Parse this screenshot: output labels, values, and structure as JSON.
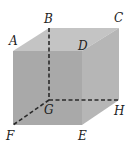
{
  "diagram": {
    "type": "cube",
    "colors": {
      "front_face": "#a9a9a9",
      "top_face": "#c4c4c4",
      "right_face": "#b6b6b6",
      "edge": "#2a2a2a",
      "label": "#222222"
    },
    "vertices": {
      "A": {
        "label": "A",
        "x": 13,
        "y": 51
      },
      "B": {
        "label": "B",
        "x": 49,
        "y": 28
      },
      "C": {
        "label": "C",
        "x": 119,
        "y": 28
      },
      "D": {
        "label": "D",
        "x": 82,
        "y": 51
      },
      "E": {
        "label": "E",
        "x": 82,
        "y": 125
      },
      "F": {
        "label": "F",
        "x": 13,
        "y": 125
      },
      "G": {
        "label": "G",
        "x": 49,
        "y": 100
      },
      "H": {
        "label": "H",
        "x": 119,
        "y": 100
      }
    },
    "labels": [
      {
        "id": "A",
        "text": "A",
        "x": 9,
        "y": 45
      },
      {
        "id": "B",
        "text": "B",
        "x": 44,
        "y": 23
      },
      {
        "id": "C",
        "text": "C",
        "x": 114,
        "y": 22
      },
      {
        "id": "D",
        "text": "D",
        "x": 78,
        "y": 50
      },
      {
        "id": "G",
        "text": "G",
        "x": 44,
        "y": 114
      },
      {
        "id": "H",
        "text": "H",
        "x": 114,
        "y": 115
      },
      {
        "id": "F",
        "text": "F",
        "x": 6,
        "y": 140
      },
      {
        "id": "E",
        "text": "E",
        "x": 78,
        "y": 140
      }
    ],
    "hidden_edges": [
      "BG",
      "GF",
      "GH"
    ]
  }
}
